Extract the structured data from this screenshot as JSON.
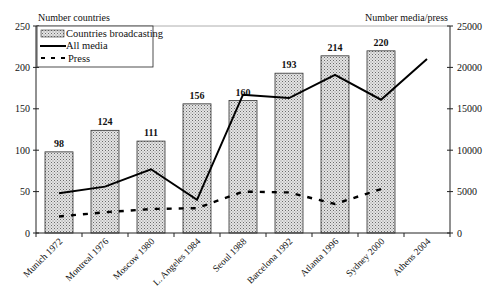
{
  "chart_data": {
    "type": "bar",
    "title": "",
    "categories": [
      "Munich 1972",
      "Montreal 1976",
      "Moscow 1980",
      "L. Angeles 1984",
      "Seoul 1988",
      "Barcelona 1992",
      "Atlanta 1996",
      "Sydney 2000",
      "Athens 2004"
    ],
    "left_axis": {
      "label": "Number countries",
      "ylim": [
        0,
        250
      ],
      "ticks": [
        0,
        50,
        100,
        150,
        200,
        250
      ]
    },
    "right_axis": {
      "label": "Number media/press",
      "ylim": [
        0,
        25000
      ],
      "ticks": [
        0,
        5000,
        10000,
        15000,
        20000,
        25000
      ]
    },
    "series": [
      {
        "name": "Countries broadcasting",
        "type": "bar",
        "axis": "left",
        "values": [
          98,
          124,
          111,
          156,
          160,
          193,
          214,
          220,
          null
        ],
        "labels": [
          "98",
          "124",
          "111",
          "156",
          "160",
          "193",
          "214",
          "220",
          ""
        ]
      },
      {
        "name": "All media",
        "type": "line",
        "style": "solid",
        "axis": "right",
        "values": [
          4800,
          5600,
          7700,
          4000,
          16700,
          16300,
          19100,
          16100,
          21000
        ]
      },
      {
        "name": "Press",
        "type": "line",
        "style": "dashed",
        "axis": "right",
        "values": [
          2000,
          2500,
          2900,
          3000,
          5000,
          4900,
          3500,
          5300,
          null
        ]
      }
    ],
    "legend": {
      "position": "top-left inside",
      "entries": [
        "Countries broadcasting",
        "All media",
        "Press"
      ]
    },
    "grid": false
  },
  "colors": {
    "bar_fill": "#c9c9c9",
    "line": "#000000",
    "axis": "#222222"
  }
}
